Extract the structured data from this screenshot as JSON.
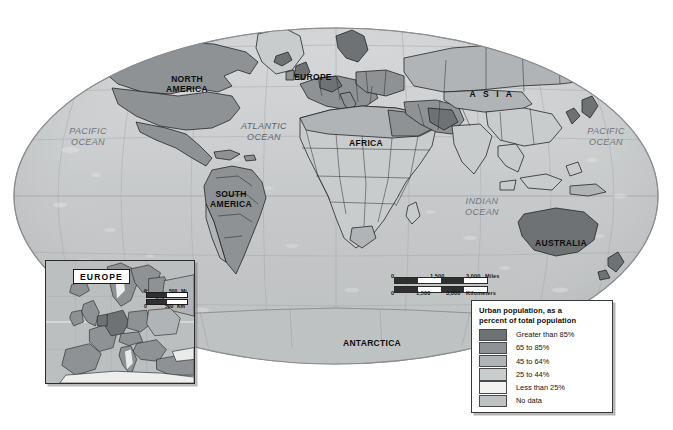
{
  "map": {
    "title": "World map of urban population as a percent of total population",
    "projection": "oval",
    "continent_labels": [
      {
        "name": "north-america",
        "text": "NORTH\nAMERICA",
        "x": 152,
        "y": 75,
        "w": 70
      },
      {
        "name": "south-america",
        "text": "SOUTH\nAMERICA",
        "x": 196,
        "y": 190,
        "w": 70
      },
      {
        "name": "europe",
        "text": "EUROPE",
        "x": 284,
        "y": 73,
        "w": 58
      },
      {
        "name": "africa",
        "text": "AFRICA",
        "x": 340,
        "y": 139,
        "w": 52
      },
      {
        "name": "asia",
        "text": "A S I A",
        "x": 462,
        "y": 90,
        "w": 60
      },
      {
        "name": "australia",
        "text": "AUSTRALIA",
        "x": 528,
        "y": 239,
        "w": 66
      },
      {
        "name": "antarctica",
        "text": "ANTARCTICA",
        "x": 333,
        "y": 339,
        "w": 78
      }
    ],
    "ocean_labels": [
      {
        "name": "pacific-ocean-west",
        "text": "PACIFIC\nOCEAN",
        "x": 56,
        "y": 126,
        "w": 64
      },
      {
        "name": "atlantic-ocean",
        "text": "ATLANTIC\nOCEAN",
        "x": 229,
        "y": 121,
        "w": 70
      },
      {
        "name": "indian-ocean",
        "text": "INDIAN\nOCEAN",
        "x": 453,
        "y": 196,
        "w": 58
      },
      {
        "name": "pacific-ocean-east",
        "text": "PACIFIC\nOCEAN",
        "x": 574,
        "y": 126,
        "w": 64
      }
    ]
  },
  "scale_bar": {
    "miles": {
      "ticks": [
        "0",
        "1,500",
        "3,000"
      ],
      "unit": "Miles"
    },
    "kilometers": {
      "ticks": [
        "0",
        "1,500",
        "3,000"
      ],
      "unit": "Kilometers"
    }
  },
  "legend": {
    "title": "Urban population, as a\npercent of total population",
    "items": [
      {
        "label": "Greater than 85%",
        "color": "#6e7275"
      },
      {
        "label": "65 to 85%",
        "color": "#8e9295"
      },
      {
        "label": "45 to 64%",
        "color": "#b0b4b6"
      },
      {
        "label": "25 to 44%",
        "color": "#c9cccd"
      },
      {
        "label": "Less than 25%",
        "color": "#f2f2f1"
      },
      {
        "label": "No data",
        "color": "#bfc2c3"
      }
    ]
  },
  "inset": {
    "title": "EUROPE",
    "scale_bar": {
      "miles": {
        "ticks": [
          "0",
          "500"
        ],
        "unit": "Mi"
      },
      "kilometers": {
        "ticks": [
          "0",
          "500"
        ],
        "unit": "Km"
      }
    }
  },
  "chart_data": {
    "type": "choropleth-map",
    "title": "Urban population, as a percent of total population",
    "value_label": "Urban population (% of total population)",
    "classes": [
      {
        "label": "Greater than 85%",
        "range": [
          85,
          100
        ],
        "color": "#6e7275"
      },
      {
        "label": "65 to 85%",
        "range": [
          65,
          85
        ],
        "color": "#8e9295"
      },
      {
        "label": "45 to 64%",
        "range": [
          45,
          64
        ],
        "color": "#b0b4b6"
      },
      {
        "label": "25 to 44%",
        "range": [
          25,
          44
        ],
        "color": "#c9cccd"
      },
      {
        "label": "Less than 25%",
        "range": [
          0,
          25
        ],
        "color": "#f2f2f1"
      },
      {
        "label": "No data",
        "range": null,
        "color": "#bfc2c3"
      }
    ],
    "regions": [
      {
        "name": "North America",
        "class": "65 to 85%"
      },
      {
        "name": "South America",
        "class": "65 to 85%"
      },
      {
        "name": "Europe",
        "class": "65 to 85%"
      },
      {
        "name": "Africa",
        "class": "25 to 44%"
      },
      {
        "name": "Asia",
        "class": "25 to 44%"
      },
      {
        "name": "Australia",
        "class": "Greater than 85%"
      },
      {
        "name": "Antarctica",
        "class": "No data"
      }
    ],
    "legend_position": "bottom-right",
    "inset_map": "Europe",
    "grid": true
  }
}
